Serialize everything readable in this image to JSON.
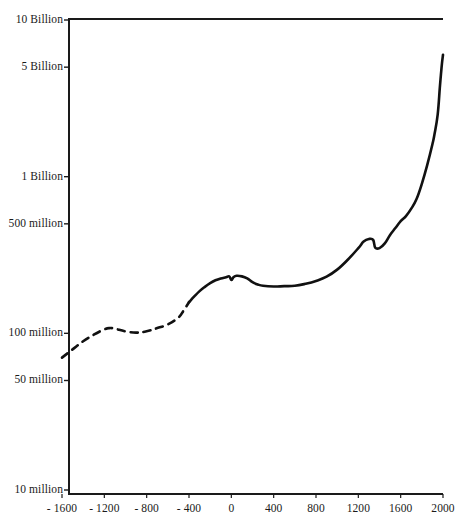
{
  "chart_data": {
    "type": "line",
    "title": "",
    "subtitle": "",
    "xlabel": "",
    "ylabel": "",
    "yscale": "log",
    "xscale": "linear",
    "grid": false,
    "legend": null,
    "xlim": [
      -1700,
      2030
    ],
    "ylim": [
      10000000,
      10000000000
    ],
    "xticks": [
      -1600,
      -1200,
      -800,
      -400,
      0,
      400,
      800,
      1200,
      1600,
      2000
    ],
    "xtick_labels": [
      "- 1600",
      "- 1200",
      "- 800",
      "- 400",
      "0",
      "400",
      "800",
      "1200",
      "1600",
      "2000"
    ],
    "yticks": [
      10000000,
      50000000,
      100000000,
      500000000,
      1000000000,
      5000000000,
      10000000000
    ],
    "ytick_labels": [
      "10 million",
      "50 million",
      "100 million",
      "500 million",
      "1 Billion",
      "5 Billion",
      "10 Billion"
    ],
    "line_color": "#111111",
    "line_width": 2.6,
    "series": [
      {
        "name": "world-population-estimated",
        "style": "dashed",
        "x": [
          -1700,
          -1600,
          -1500,
          -1400,
          -1300,
          -1200,
          -1150,
          -1100,
          -1000,
          -900,
          -800,
          -700,
          -600,
          -500,
          -450,
          -400
        ],
        "values": [
          66000000,
          70000000,
          79000000,
          89000000,
          98000000,
          106000000,
          108000000,
          107000000,
          103000000,
          101000000,
          103000000,
          108000000,
          114000000,
          126000000,
          140000000,
          158000000
        ]
      },
      {
        "name": "world-population-recorded",
        "style": "solid",
        "x": [
          -400,
          -350,
          -300,
          -250,
          -200,
          -150,
          -100,
          -50,
          -20,
          0,
          20,
          50,
          100,
          150,
          200,
          250,
          300,
          400,
          500,
          600,
          700,
          800,
          900,
          1000,
          1100,
          1200,
          1250,
          1300,
          1340,
          1360,
          1400,
          1450,
          1500,
          1550,
          1600,
          1650,
          1700,
          1750,
          1800,
          1850,
          1900,
          1920,
          1950,
          1970,
          1980,
          1990,
          2000
        ],
        "values": [
          158000000,
          172000000,
          186000000,
          198000000,
          209000000,
          218000000,
          224000000,
          228000000,
          231000000,
          219000000,
          228000000,
          233000000,
          231000000,
          224000000,
          212000000,
          205000000,
          201000000,
          199000000,
          200000000,
          201000000,
          207000000,
          216000000,
          230000000,
          255000000,
          295000000,
          350000000,
          385000000,
          400000000,
          395000000,
          352000000,
          350000000,
          375000000,
          425000000,
          470000000,
          520000000,
          560000000,
          625000000,
          720000000,
          900000000,
          1180000000,
          1610000000,
          1870000000,
          2500000000,
          3700000000,
          4450000000,
          5270000000,
          6000000000
        ]
      }
    ]
  },
  "axes": {
    "frame_color": "#1a1a1a"
  }
}
